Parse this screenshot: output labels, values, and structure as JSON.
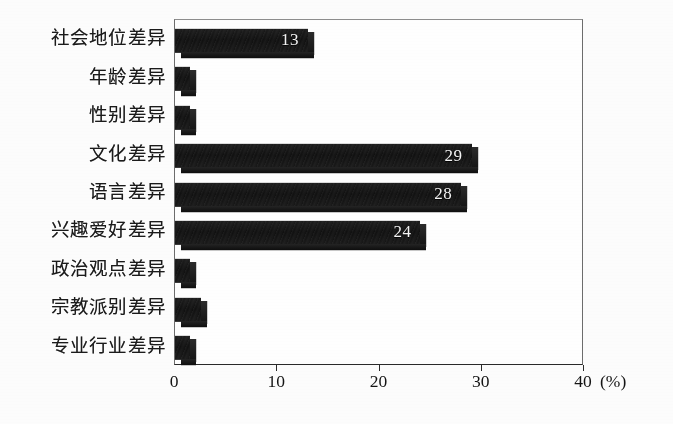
{
  "chart_data": {
    "type": "bar",
    "orientation": "horizontal",
    "title": "",
    "subtitle": "",
    "xlabel": "(%)",
    "ylabel": "",
    "categories": [
      "社会地位差异",
      "年龄差异",
      "性别差异",
      "文化差异",
      "语言差异",
      "兴趣爱好差异",
      "政治观点差异",
      "宗教派别差异",
      "专业行业差异"
    ],
    "values": [
      13,
      1.5,
      1.5,
      29,
      28,
      24,
      1.5,
      2.5,
      1.5
    ],
    "data_labels": [
      "13",
      "",
      "",
      "29",
      "28",
      "24",
      "",
      "",
      ""
    ],
    "xlim": [
      0,
      40
    ],
    "xticks": [
      0,
      10,
      20,
      30,
      40
    ],
    "xtick_labels": [
      "0",
      "10",
      "20",
      "30",
      "40"
    ],
    "unit_label": "(%)",
    "grid": false,
    "legend": false,
    "bar_style": "3d-extruded",
    "colors": {
      "bar_face": "#141414",
      "bar_bevel": "#dcdcdc",
      "axis": "#2b2b2b",
      "plot_border": "#6d6d6d",
      "background": "#ffffff",
      "label_text": "#1b1b1b",
      "value_text": "#f4f4f4"
    }
  }
}
